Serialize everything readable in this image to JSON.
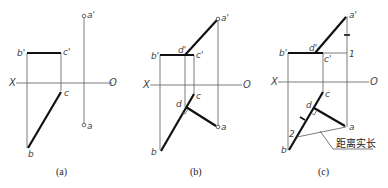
{
  "figure": {
    "panels": [
      {
        "caption": "(a)",
        "axis": {
          "left": "X",
          "right": "O"
        },
        "labels": {
          "b_prime": "b'",
          "c_prime": "c'",
          "a_prime": "a'",
          "c": "c",
          "b": "b",
          "a": "a"
        }
      },
      {
        "caption": "(b)",
        "axis": {
          "left": "X",
          "right": "O"
        },
        "labels": {
          "b_prime": "b'",
          "d_prime": "d'",
          "c_prime": "c'",
          "a_prime": "a'",
          "c": "c",
          "d": "d",
          "b": "b",
          "a": "a"
        }
      },
      {
        "caption": "(c)",
        "axis": {
          "left": "X",
          "right": "O"
        },
        "labels": {
          "b_prime": "b'",
          "d_prime": "d'",
          "c_prime": "c'",
          "a_prime": "a'",
          "one": "1",
          "c": "c",
          "d": "d",
          "two": "2",
          "b": "b",
          "a": "a"
        },
        "annotation": "距离实长"
      }
    ]
  }
}
